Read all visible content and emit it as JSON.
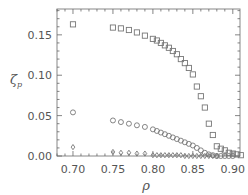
{
  "chart_data": {
    "type": "scatter",
    "title": "",
    "xlabel": "ρ",
    "ylabel": "ζ",
    "ylabel_sub": "p",
    "xlim": [
      0.68,
      0.909
    ],
    "ylim": [
      0.0,
      0.182
    ],
    "grid": false,
    "legend": null,
    "xticks": [
      0.7,
      0.75,
      0.8,
      0.85,
      0.9
    ],
    "xtick_labels": [
      "0.70",
      "0.75",
      "0.80",
      "0.85",
      "0.90"
    ],
    "yticks": [
      0.0,
      0.05,
      0.1,
      0.15
    ],
    "ytick_labels": [
      "0.00",
      "0.05",
      "0.10",
      "0.15"
    ],
    "series": [
      {
        "name": "squares",
        "marker": "square",
        "x": [
          0.7,
          0.75,
          0.76,
          0.77,
          0.78,
          0.79,
          0.8,
          0.805,
          0.81,
          0.815,
          0.82,
          0.825,
          0.83,
          0.835,
          0.84,
          0.845,
          0.85,
          0.855,
          0.86,
          0.865,
          0.87,
          0.875,
          0.88,
          0.885,
          0.89,
          0.895,
          0.9,
          0.905,
          0.91
        ],
        "y": [
          0.163,
          0.159,
          0.158,
          0.156,
          0.153,
          0.149,
          0.145,
          0.143,
          0.14,
          0.137,
          0.134,
          0.13,
          0.126,
          0.12,
          0.115,
          0.109,
          0.101,
          0.086,
          0.074,
          0.06,
          0.04,
          0.026,
          0.012,
          0.009,
          0.007,
          0.004,
          0.003,
          0.002,
          0.001
        ]
      },
      {
        "name": "circles",
        "marker": "circle",
        "x": [
          0.7,
          0.75,
          0.76,
          0.77,
          0.78,
          0.79,
          0.8,
          0.805,
          0.81,
          0.815,
          0.82,
          0.825,
          0.83,
          0.835,
          0.84,
          0.845,
          0.85,
          0.855,
          0.86,
          0.865,
          0.87,
          0.875,
          0.88,
          0.885,
          0.89,
          0.895,
          0.9
        ],
        "y": [
          0.054,
          0.044,
          0.042,
          0.04,
          0.038,
          0.036,
          0.033,
          0.031,
          0.029,
          0.027,
          0.025,
          0.023,
          0.021,
          0.019,
          0.017,
          0.015,
          0.013,
          0.01,
          0.007,
          0.004,
          0.002,
          0.001,
          0.0,
          0.0,
          0.0,
          0.0,
          0.0
        ]
      },
      {
        "name": "diamonds",
        "marker": "diamond",
        "x": [
          0.7,
          0.75,
          0.76,
          0.77,
          0.78,
          0.79,
          0.8,
          0.805,
          0.81,
          0.815,
          0.82,
          0.825,
          0.83,
          0.835,
          0.84,
          0.845,
          0.85,
          0.855,
          0.86,
          0.865,
          0.87,
          0.875,
          0.88
        ],
        "y": [
          0.011,
          0.005,
          0.004,
          0.004,
          0.003,
          0.003,
          0.001,
          0.001,
          0.001,
          0.001,
          0.001,
          0.001,
          0.001,
          0.001,
          0.0,
          0.0,
          0.0,
          0.0,
          0.0,
          0.0,
          0.0,
          0.0,
          0.0
        ]
      }
    ],
    "colors": {
      "axis": "#666666",
      "marker": "#777777",
      "text": "#555555"
    }
  }
}
